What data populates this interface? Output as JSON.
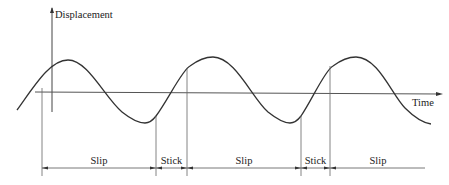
{
  "diagram": {
    "y_axis_label": "Displacement",
    "x_axis_label": "Time",
    "colors": {
      "stroke": "#333333",
      "line": "#555555",
      "background": "#ffffff"
    },
    "phases": [
      {
        "label": "Slip"
      },
      {
        "label": "Stick"
      },
      {
        "label": "Slip"
      },
      {
        "label": "Stick"
      },
      {
        "label": "Slip"
      }
    ]
  }
}
